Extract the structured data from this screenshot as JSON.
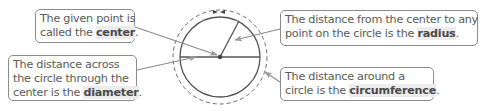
{
  "callouts": {
    "center": {
      "line1": "The given point is",
      "line2_pre": "called the ",
      "term": "center",
      "end": "."
    },
    "diameter": {
      "line1": "The distance across",
      "line2": "the circle through the",
      "line3_pre": "center is the ",
      "term": "diameter",
      "end": "."
    },
    "radius": {
      "line1": "The distance from the center to any",
      "line2_pre": "point on the circle is the ",
      "term": "radius",
      "end": "."
    },
    "circumference": {
      "line1": "The distance around a",
      "line2_pre": "circle is the ",
      "term": "circumference",
      "end": "."
    }
  },
  "colors": {
    "line": "#5a5a5a",
    "arrow": "#999999",
    "border": "#8c8c8c",
    "text": "#5a5a5a",
    "highlight": "#ececec"
  }
}
